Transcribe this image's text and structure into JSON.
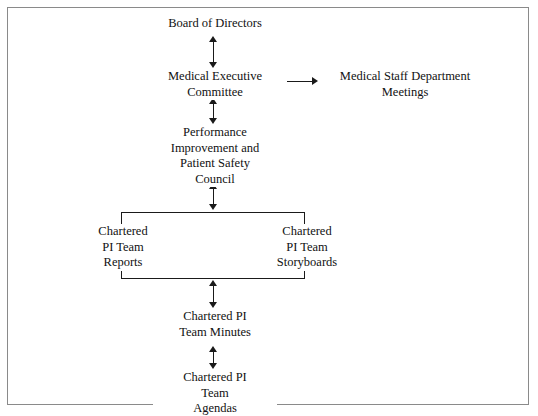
{
  "diagram": {
    "title_text": "Performance Improvement and Patient Safety reporting structure",
    "background_color": "#ffffff",
    "line_color": "#1a1a1a",
    "border_color": "#8a8a8a",
    "nodes": {
      "board": "Board of Directors",
      "mec": "Medical Executive\nCommittee",
      "med_staff": "Medical Staff Department\nMeetings",
      "council": "Performance\nImprovement and\nPatient Safety\nCouncil",
      "reports": "Chartered\nPI Team\nReports",
      "storyboards": "Chartered\nPI Team\nStoryboards",
      "minutes": "Chartered PI\nTeam Minutes",
      "agendas": "Chartered PI\nTeam\nAgendas"
    },
    "connectors": [
      {
        "name": "board-to-mec",
        "from": "Board of Directors",
        "to": "Medical Executive Committee",
        "style": "double-headed-vertical"
      },
      {
        "name": "mec-to-council",
        "from": "Medical Executive Committee",
        "to": "Performance Improvement and Patient Safety Council",
        "style": "double-headed-vertical"
      },
      {
        "name": "mec-to-medstaff",
        "from": "Medical Executive Committee",
        "to": "Medical Staff Department Meetings",
        "style": "double-headed-horizontal"
      },
      {
        "name": "council-to-teams",
        "from": "Performance Improvement and Patient Safety Council",
        "to": "Chartered PI Team bracket",
        "style": "double-headed-vertical"
      },
      {
        "name": "teams-to-minutes",
        "from": "Chartered PI Team bracket",
        "to": "Chartered PI Team Minutes",
        "style": "double-headed-vertical"
      },
      {
        "name": "minutes-to-agendas",
        "from": "Chartered PI Team Minutes",
        "to": "Chartered PI Team Agendas",
        "style": "double-headed-vertical"
      }
    ]
  }
}
